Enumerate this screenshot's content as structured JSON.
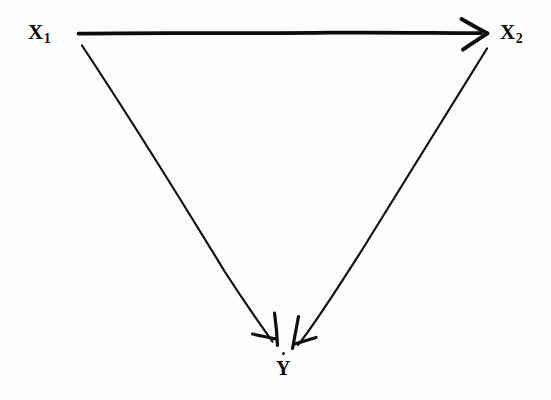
{
  "figure": {
    "type": "path-diagram",
    "background_color": "#fdfdfd",
    "ink_color": "#0b0b0b",
    "width": 551,
    "height": 400
  },
  "nodes": [
    {
      "id": "x1",
      "base": "X",
      "subscript": "1",
      "x": 42,
      "y": 33,
      "name": "node-x1"
    },
    {
      "id": "x2",
      "base": "X",
      "subscript": "2",
      "x": 512,
      "y": 33,
      "name": "node-x2"
    },
    {
      "id": "y",
      "base": "Y",
      "subscript": "",
      "x": 284,
      "y": 371,
      "name": "node-y"
    }
  ],
  "edges": [
    {
      "id": "x1-to-x2",
      "from": "x1",
      "to": "x2",
      "label": "",
      "style": "solid",
      "stroke_width": 3.6,
      "arrowhead": "open-v",
      "x1": 78,
      "y1": 33,
      "x2": 480,
      "y2": 33
    },
    {
      "id": "x1-to-y",
      "from": "x1",
      "to": "y",
      "label": "",
      "style": "solid",
      "stroke_width": 2.1,
      "arrowhead": "open-v",
      "x1": 82,
      "y1": 46,
      "x2": 277,
      "y2": 344
    },
    {
      "id": "x2-to-y",
      "from": "x2",
      "to": "y",
      "label": "",
      "style": "solid",
      "stroke_width": 2.1,
      "arrowhead": "open-v",
      "x1": 487,
      "y1": 49,
      "x2": 293,
      "y2": 347
    }
  ],
  "artifacts": [
    {
      "id": "y-dot",
      "kind": "scan-speck",
      "x": 283,
      "y": 353
    }
  ]
}
